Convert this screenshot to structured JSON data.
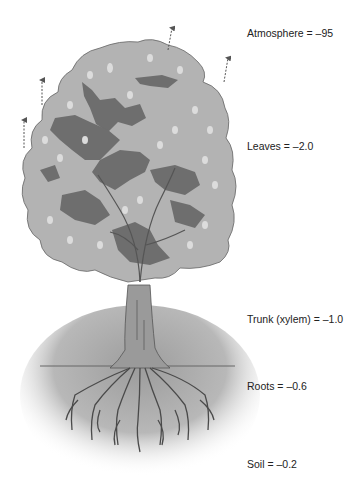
{
  "diagram": {
    "title": "",
    "labels": [
      {
        "id": "atmosphere",
        "text": "Atmosphere = –95",
        "x": 247,
        "y": 27
      },
      {
        "id": "leaves",
        "text": "Leaves = –2.0",
        "x": 247,
        "y": 140
      },
      {
        "id": "trunk",
        "text": "Trunk (xylem) = –1.0",
        "x": 247,
        "y": 313
      },
      {
        "id": "roots",
        "text": "Roots = –0.6",
        "x": 247,
        "y": 380
      },
      {
        "id": "soil",
        "text": "Soil = –0.2",
        "x": 247,
        "y": 458
      }
    ],
    "colors": {
      "canopy_light": "#b3b3b3",
      "canopy_dark": "#6e6e6e",
      "trunk": "#9a9a9a",
      "soil": "#a6a6a6",
      "roots": "#555555",
      "arrow": "#555555",
      "text": "#222222"
    },
    "arrows": [
      {
        "x": 42,
        "y1": 140,
        "y2": 110
      },
      {
        "x": 24,
        "y1": 140,
        "y2": 110
      },
      {
        "x": 170,
        "y1": 50,
        "y2": 25
      },
      {
        "x": 224,
        "y1": 82,
        "y2": 56
      }
    ]
  }
}
